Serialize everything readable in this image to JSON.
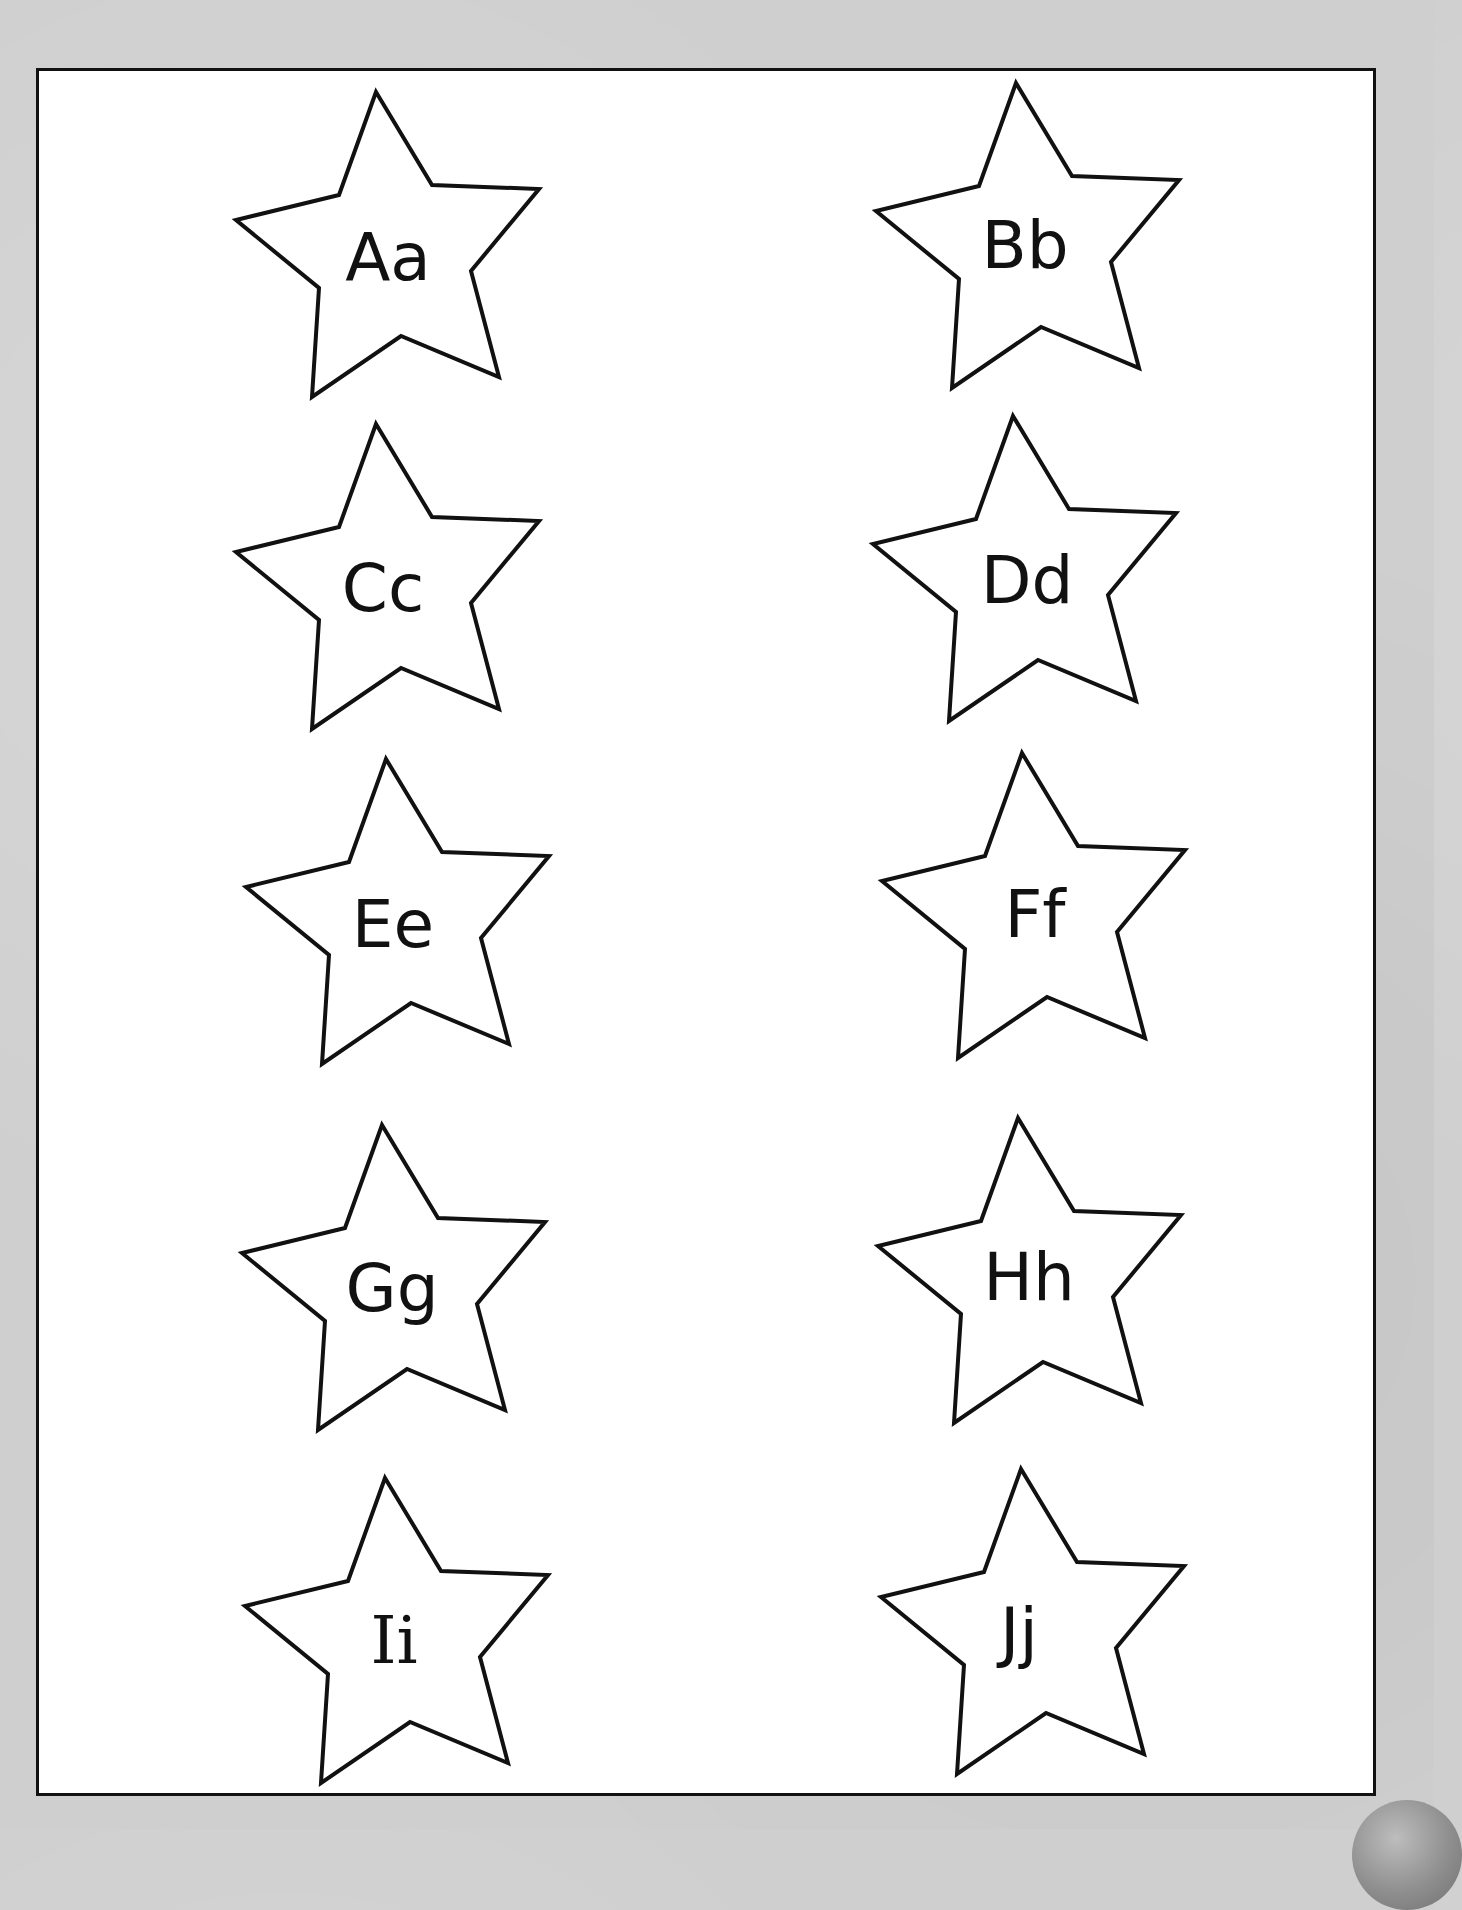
{
  "worksheet": {
    "background_color": "#cfcfcf",
    "sheet_color": "#ffffff",
    "stroke_color": "#111111",
    "stars": [
      {
        "label": "Aa",
        "column": "left",
        "row": 1
      },
      {
        "label": "Bb",
        "column": "right",
        "row": 1
      },
      {
        "label": "Cc",
        "column": "left",
        "row": 2
      },
      {
        "label": "Dd",
        "column": "right",
        "row": 2
      },
      {
        "label": "Ee",
        "column": "left",
        "row": 3
      },
      {
        "label": "Ff",
        "column": "right",
        "row": 3
      },
      {
        "label": "Gg",
        "column": "left",
        "row": 4
      },
      {
        "label": "Hh",
        "column": "right",
        "row": 4
      },
      {
        "label": "Ii",
        "column": "left",
        "row": 5
      },
      {
        "label": "Jj",
        "column": "right",
        "row": 5
      }
    ]
  }
}
